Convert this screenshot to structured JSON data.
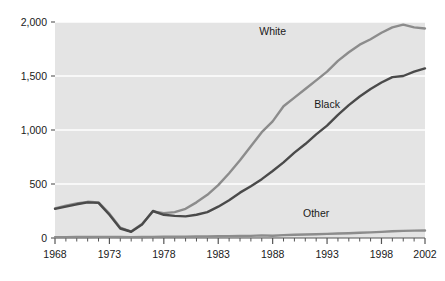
{
  "chart_data": {
    "type": "line",
    "title": "",
    "subtitle": "",
    "xlabel": "",
    "ylabel": "",
    "xlim": [
      1968,
      2002
    ],
    "ylim": [
      0,
      2000
    ],
    "grid": true,
    "grid_axis": "y",
    "grid_color": "#ffffff",
    "plot_background": "#e4e4e4",
    "legend_position": "inline-labels",
    "x_tick_labels": [
      "1968",
      "1973",
      "1978",
      "1983",
      "1988",
      "1993",
      "1998",
      "2002"
    ],
    "x_tick_values": [
      1968,
      1973,
      1978,
      1983,
      1988,
      1993,
      1998,
      2002
    ],
    "x_minor_tick_step": 1,
    "y_tick_labels": [
      "0",
      "500",
      "1,000",
      "1,500",
      "2,000"
    ],
    "y_tick_values": [
      0,
      500,
      1000,
      1500,
      2000
    ],
    "x": [
      1968,
      1969,
      1970,
      1971,
      1972,
      1973,
      1974,
      1975,
      1976,
      1977,
      1978,
      1979,
      1980,
      1981,
      1982,
      1983,
      1984,
      1985,
      1986,
      1987,
      1988,
      1989,
      1990,
      1991,
      1992,
      1993,
      1994,
      1995,
      1996,
      1997,
      1998,
      1999,
      2000,
      2001,
      2002
    ],
    "series": [
      {
        "name": "White",
        "color": "#8c8c8c",
        "label_x": 1988,
        "label_y": 1880,
        "values": [
          275,
          300,
          320,
          335,
          330,
          225,
          95,
          60,
          130,
          245,
          230,
          240,
          270,
          330,
          400,
          490,
          600,
          720,
          850,
          980,
          1080,
          1220,
          1300,
          1380,
          1460,
          1540,
          1640,
          1720,
          1790,
          1840,
          1900,
          1950,
          1975,
          1950,
          1940
        ]
      },
      {
        "name": "Black",
        "color": "#4a4a4a",
        "label_x": 1993,
        "label_y": 1200,
        "values": [
          270,
          290,
          312,
          330,
          325,
          215,
          88,
          58,
          125,
          250,
          215,
          205,
          200,
          215,
          240,
          290,
          350,
          420,
          480,
          545,
          620,
          700,
          790,
          870,
          960,
          1040,
          1140,
          1230,
          1310,
          1380,
          1440,
          1490,
          1500,
          1540,
          1570
        ]
      },
      {
        "name": "Other",
        "color": "#8c8c8c",
        "label_x": 1992,
        "label_y": 195,
        "values": [
          8,
          8,
          9,
          9,
          10,
          10,
          9,
          8,
          9,
          10,
          11,
          12,
          13,
          14,
          15,
          16,
          17,
          19,
          20,
          24,
          21,
          27,
          30,
          33,
          35,
          38,
          41,
          44,
          48,
          52,
          57,
          62,
          66,
          68,
          70
        ]
      }
    ]
  }
}
